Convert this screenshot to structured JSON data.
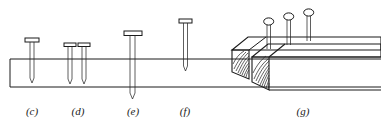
{
  "figure": {
    "kind": "line-drawing",
    "background_color": "#ffffff",
    "ink_color": "#1a1a1a",
    "width": 381,
    "height": 138
  },
  "board": {
    "name": "board-cross-section",
    "top_y": 59,
    "bottom_y": 87,
    "left_x": 10,
    "right_x": 381
  },
  "panels": [
    {
      "id": "c",
      "label": "(c)",
      "label_x": 32,
      "label_y": 112,
      "nails": [
        {
          "head_x": 32,
          "head_y": 40,
          "head_w": 14,
          "tip_y": 82,
          "through": false
        }
      ]
    },
    {
      "id": "d",
      "label": "(d)",
      "label_x": 78,
      "label_y": 112,
      "nails": [
        {
          "head_x": 70,
          "head_y": 44,
          "head_w": 12,
          "tip_y": 83,
          "through": false
        },
        {
          "head_x": 84,
          "head_y": 44,
          "head_w": 12,
          "tip_y": 83,
          "through": false
        }
      ]
    },
    {
      "id": "e",
      "label": "(e)",
      "label_x": 133,
      "label_y": 112,
      "nails": [
        {
          "head_x": 133,
          "head_y": 33,
          "head_w": 18,
          "tip_y": 98,
          "through": true
        }
      ]
    },
    {
      "id": "f",
      "label": "(f)",
      "label_x": 185,
      "label_y": 112,
      "nails": [
        {
          "head_x": 185,
          "head_y": 21,
          "head_w": 13,
          "tip_y": 70,
          "through": false
        }
      ]
    },
    {
      "id": "g",
      "label": "(g)",
      "label_x": 303,
      "label_y": 112,
      "beam_nails": [
        {
          "head_x": 269,
          "head_y": 20,
          "shank_bottom_y": 48
        },
        {
          "head_x": 289,
          "head_y": 15,
          "shank_bottom_y": 43
        },
        {
          "head_x": 309,
          "head_y": 11,
          "shank_bottom_y": 39
        }
      ]
    }
  ],
  "labels": {
    "c": "(c)",
    "d": "(d)",
    "e": "(e)",
    "f": "(f)",
    "g": "(g)"
  }
}
